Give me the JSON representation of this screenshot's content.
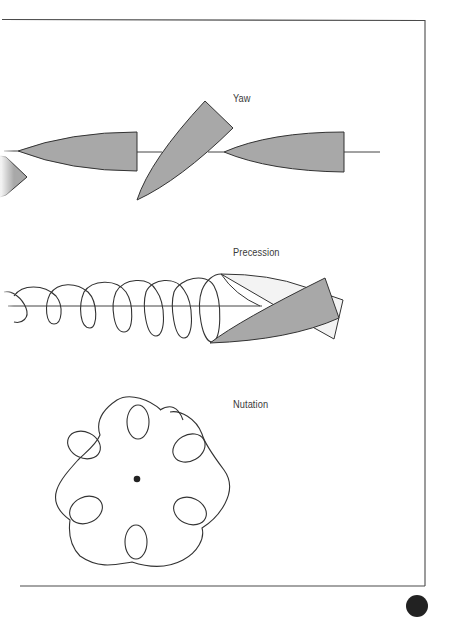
{
  "figure": {
    "labels": {
      "yaw": "Yaw",
      "precession": "Precession",
      "nutation": "Nutation"
    },
    "sections": [
      {
        "name": "yaw",
        "label": "Yaw",
        "description": "Projectile shown aligned with flight axis, yawed at an angle, then aligned again"
      },
      {
        "name": "precession",
        "label": "Precession",
        "description": "Helical spiral path of the projectile nose around the flight axis, with projectile tilted at end"
      },
      {
        "name": "nutation",
        "label": "Nutation",
        "description": "Rosette-shaped loop pattern around a central point"
      }
    ]
  },
  "colors": {
    "frame": "#4a4a4a",
    "stroke": "#333333",
    "projectile_fill": "#a8a8a8",
    "ghost_fill": "#f2f2f2",
    "label_text": "#3a3a3a",
    "background": "#ffffff"
  }
}
